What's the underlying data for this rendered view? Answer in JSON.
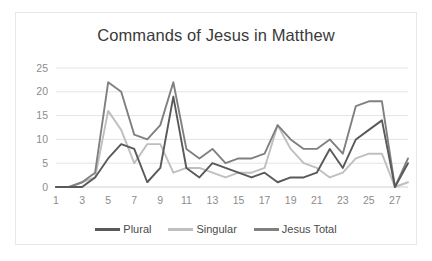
{
  "chart_data": {
    "type": "line",
    "title": "Commands of Jesus in Matthew",
    "xlabel": "",
    "ylabel": "",
    "ylim": [
      0,
      25
    ],
    "yticks": [
      0,
      5,
      10,
      15,
      20,
      25
    ],
    "grid": true,
    "legend_position": "bottom",
    "categories": [
      1,
      2,
      3,
      4,
      5,
      6,
      7,
      8,
      9,
      10,
      11,
      12,
      13,
      14,
      15,
      16,
      17,
      18,
      19,
      20,
      21,
      22,
      23,
      24,
      25,
      26,
      27,
      28
    ],
    "xtick_labels": [
      "1",
      "3",
      "5",
      "7",
      "9",
      "11",
      "13",
      "15",
      "17",
      "19",
      "21",
      "23",
      "25",
      "27"
    ],
    "series": [
      {
        "name": "Plural",
        "color": "#595959",
        "values": [
          0,
          0,
          0,
          2,
          6,
          9,
          8,
          1,
          4,
          19,
          4,
          2,
          5,
          4,
          3,
          2,
          3,
          1,
          2,
          2,
          3,
          8,
          4,
          10,
          12,
          14,
          0,
          5
        ]
      },
      {
        "name": "Singular",
        "color": "#bfbfbf",
        "values": [
          0,
          0,
          1,
          2,
          16,
          12,
          5,
          9,
          9,
          3,
          4,
          4,
          3,
          2,
          3,
          3,
          4,
          13,
          8,
          5,
          4,
          2,
          3,
          6,
          7,
          7,
          0,
          1
        ]
      },
      {
        "name": "Jesus Total",
        "color": "#808080",
        "values": [
          0,
          0,
          1,
          3,
          22,
          20,
          11,
          10,
          13,
          22,
          8,
          6,
          8,
          5,
          6,
          6,
          7,
          13,
          10,
          8,
          8,
          10,
          7,
          17,
          18,
          18,
          0,
          6
        ]
      }
    ]
  },
  "legend": {
    "items": [
      {
        "label": "Plural",
        "color": "#595959"
      },
      {
        "label": "Singular",
        "color": "#bfbfbf"
      },
      {
        "label": "Jesus Total",
        "color": "#808080"
      }
    ]
  }
}
